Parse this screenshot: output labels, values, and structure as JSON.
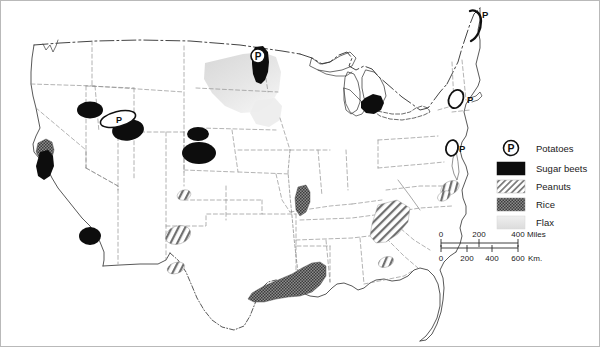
{
  "figure": {
    "domain": "map",
    "background_color": "#ffffff",
    "outline_color": "#3a3a3a",
    "border_color": "#9a9a9a"
  },
  "legend": {
    "title": "",
    "items": [
      {
        "key": "potatoes",
        "label": "Potatoes",
        "symbol": "circled-p",
        "color": "#111111"
      },
      {
        "key": "sugar_beets",
        "label": "Sugar beets",
        "symbol": "solid-swatch",
        "color": "#0d0d0d"
      },
      {
        "key": "peanuts",
        "label": "Peanuts",
        "symbol": "hatch-swatch",
        "color": "#6f6f6f"
      },
      {
        "key": "rice",
        "label": "Rice",
        "symbol": "stipple-swatch",
        "color": "#5a5a5a"
      },
      {
        "key": "flax",
        "label": "Flax",
        "symbol": "light-swatch",
        "color": "#e2e2e2"
      }
    ]
  },
  "scale_bar": {
    "miles": {
      "ticks": [
        "0",
        "200",
        "400"
      ],
      "unit_label": "Miles",
      "max": 400
    },
    "kilometers": {
      "ticks": [
        "0",
        "200",
        "400",
        "600"
      ],
      "unit_label": "Km.",
      "max": 600
    }
  },
  "map_annotations": {
    "potato_markers": [
      {
        "id": "maine",
        "label": "P",
        "has_text_label": false,
        "region": "Aroostook County, Maine"
      },
      {
        "id": "red-river",
        "label": "P",
        "has_text_label": false,
        "region": "Red River Valley, North Dakota"
      },
      {
        "id": "idaho",
        "label": "P",
        "has_text_label": false,
        "region": "Snake River Plain, Idaho"
      },
      {
        "id": "long-island",
        "label": "P",
        "has_text_label": true,
        "region": "Long Island, New York"
      },
      {
        "id": "eastern-shore",
        "label": "P",
        "has_text_label": true,
        "region": "Eastern Shore, Virginia"
      }
    ],
    "sugar_beet_areas": [
      "Yakima Valley, Washington",
      "Snake River Plain, Idaho",
      "Sacramento Valley, California",
      "Imperial Valley, California",
      "Wyoming / Nebraska Panhandle",
      "South Platte Valley, Colorado",
      "Red River Valley, North Dakota",
      "Saginaw Valley, Michigan"
    ],
    "rice_areas": [
      "Sacramento Valley, California",
      "Grand Prairie, Arkansas",
      "Gulf Coast, Texas and Louisiana"
    ],
    "peanut_areas": [
      "Central Texas",
      "South Texas",
      "Southwest Georgia and Alabama",
      "Florida Panhandle",
      "Southeastern Virginia"
    ],
    "flax_areas": [
      "Northern Plains, North Dakota and Minnesota"
    ]
  }
}
